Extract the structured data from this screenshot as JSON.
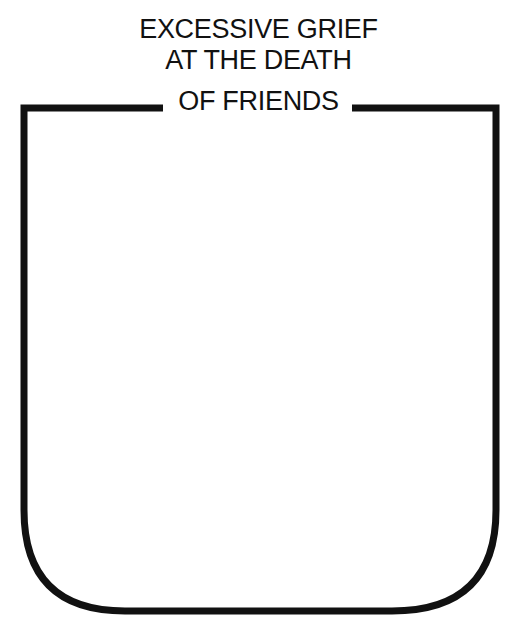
{
  "title": {
    "line1": "EXCESSIVE GRIEF",
    "line2": "AT THE DEATH",
    "line3": "OF FRIENDS"
  },
  "colors": {
    "stroke": "#111111",
    "background": "#ffffff"
  }
}
